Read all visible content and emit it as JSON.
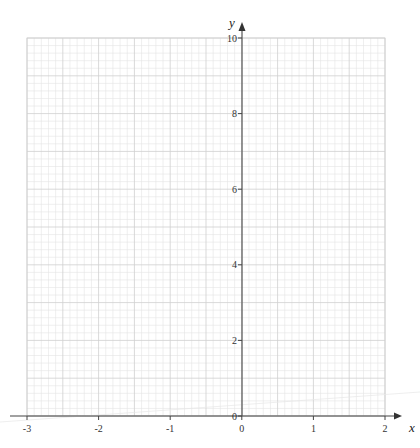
{
  "chart_data": {
    "type": "line",
    "title": "",
    "xlabel": "x",
    "ylabel": "y",
    "xlim": [
      -3,
      2
    ],
    "ylim": [
      0,
      10
    ],
    "x_ticks": [
      -3,
      -2,
      -1,
      0,
      1,
      2
    ],
    "x_tick_labels": [
      "-3",
      "-2",
      "-1",
      "0",
      "1",
      "2"
    ],
    "y_ticks": [
      0,
      2,
      4,
      6,
      8,
      10
    ],
    "y_tick_labels": [
      "0",
      "2",
      "4",
      "6",
      "8",
      "10"
    ],
    "grid": true,
    "grid_minor_x_step": 0.1,
    "grid_minor_y_step": 0.2,
    "grid_major_x_step": 0.5,
    "grid_major_y_step": 1,
    "series": [],
    "legend": "none",
    "note": "Blank graph paper axes for plotting; no data plotted"
  },
  "colors": {
    "grid_minor": "#e4e4e4",
    "grid_major": "#cfcfcf",
    "axis": "#444444"
  }
}
